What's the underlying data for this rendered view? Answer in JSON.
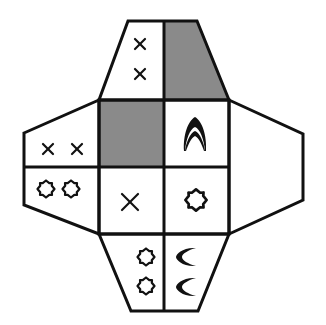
{
  "diagram": {
    "type": "cube-net-puzzle",
    "colors": {
      "line": "#111111",
      "shaded": "#8a8a8a",
      "background": "#ffffff"
    },
    "faces": [
      {
        "id": "top-left",
        "symbols": [
          "x",
          "x"
        ],
        "shaded": false
      },
      {
        "id": "top-right",
        "symbols": [],
        "shaded": true
      },
      {
        "id": "center-top-left",
        "symbols": [],
        "shaded": true
      },
      {
        "id": "center-top-right",
        "symbols": [
          "arch"
        ],
        "shaded": false
      },
      {
        "id": "center-bottom-left",
        "symbols": [
          "x"
        ],
        "shaded": false
      },
      {
        "id": "center-bottom-right",
        "symbols": [
          "octagram"
        ],
        "shaded": false
      },
      {
        "id": "left-top",
        "symbols": [
          "x",
          "x"
        ],
        "shaded": false
      },
      {
        "id": "left-bottom",
        "symbols": [
          "octagram",
          "octagram"
        ],
        "shaded": false
      },
      {
        "id": "right",
        "symbols": [],
        "shaded": false
      },
      {
        "id": "bottom-left",
        "symbols": [
          "octagram",
          "octagram"
        ],
        "shaded": false
      },
      {
        "id": "bottom-right",
        "symbols": [
          "crescent",
          "crescent"
        ],
        "shaded": false
      }
    ]
  }
}
